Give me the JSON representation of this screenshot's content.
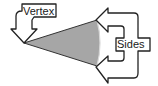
{
  "diagram": {
    "title": "",
    "labels": {
      "vertex": "Vertex",
      "sides": "Sides"
    },
    "colors": {
      "sector_fill": "#a6a6a6",
      "stroke": "#222222",
      "background": "#ffffff"
    },
    "shape": "sector (angle with two sides from a vertex)"
  }
}
